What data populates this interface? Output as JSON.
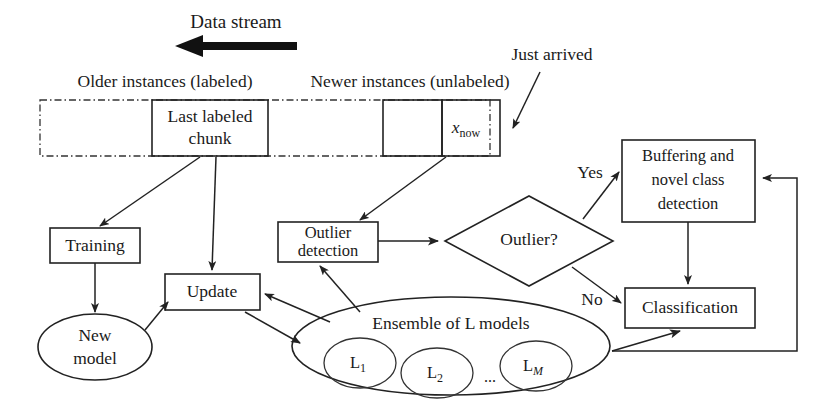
{
  "diagram": {
    "stream_header": {
      "data_stream_label": "Data stream",
      "older_instances_label": "Older instances (labeled)",
      "newer_instances_label": "Newer instances (unlabeled)",
      "just_arrived_label": "Just arrived"
    },
    "stream_boxes": {
      "last_labeled_chunk_line1": "Last labeled",
      "last_labeled_chunk_line2": "chunk",
      "x_now_base": "x",
      "x_now_subscript": "now"
    },
    "nodes": {
      "training": "Training",
      "new_model_line1": "New",
      "new_model_line2": "model",
      "update": "Update",
      "outlier_detection_line1": "Outlier",
      "outlier_detection_line2": "detection",
      "outlier_decision": "Outlier?",
      "buffering_line1": "Buffering and",
      "buffering_line2": "novel class",
      "buffering_line3": "detection",
      "classification": "Classification",
      "ensemble_title": "Ensemble of L models",
      "model_1_base": "L",
      "model_1_sub": "1",
      "model_2_base": "L",
      "model_2_sub": "2",
      "model_ellipsis": "...",
      "model_m_base": "L",
      "model_m_sub": "M"
    },
    "edge_labels": {
      "yes": "Yes",
      "no": "No"
    },
    "colors": {
      "stroke": "#222222",
      "text": "#1a1a1a",
      "background": "#ffffff",
      "dashdot_stroke": "#333333"
    }
  }
}
